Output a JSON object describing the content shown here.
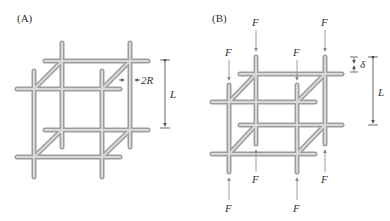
{
  "figure": {
    "panels": [
      {
        "id": "A",
        "label": "(A)",
        "annotations": {
          "rod_diameter": "2R",
          "cell_length": "L"
        }
      },
      {
        "id": "B",
        "label": "(B)",
        "annotations": {
          "force": "F",
          "displacement": "δ",
          "cell_length": "L"
        },
        "force_labels": [
          "F",
          "F",
          "F",
          "F",
          "F",
          "F",
          "F",
          "F"
        ]
      }
    ],
    "colors": {
      "rod": "#9e9e9e",
      "rod_highlight": "#d8d8d8",
      "dimension_line": "#444444",
      "force_arrow": "#888888"
    }
  }
}
